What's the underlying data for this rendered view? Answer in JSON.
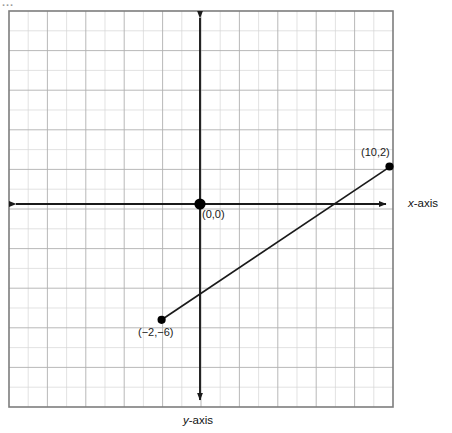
{
  "page": {
    "top_fragment": "...",
    "background": "#ffffff"
  },
  "graph": {
    "title": "",
    "x_axis_label": "x-axis",
    "x_axis_label_italic_part": "x",
    "x_axis_label_rest": "-axis",
    "y_axis_label": "y-axis",
    "y_axis_label_italic_part": "y",
    "y_axis_label_rest": "-axis",
    "frame_color": "#808080",
    "grid_color": "#cfcfcf",
    "grid_major_color": "#a8a8a8",
    "axis_color": "#1a1a1a",
    "line_color": "#1a1a1a",
    "point_color": "#000000",
    "grid": {
      "visible": true,
      "columns": 20,
      "rows": 20,
      "cell_px": 19.2
    },
    "points": [
      {
        "name": "origin",
        "label": "(0,0)",
        "x": 0,
        "y": 0,
        "radius": 5.5
      },
      {
        "name": "endpoint-upper-right",
        "label": "(10,2)",
        "x": 10,
        "y": 2,
        "radius": 4
      },
      {
        "name": "endpoint-lower-left",
        "label": "(−2,−6)",
        "x": -2,
        "y": -6,
        "radius": 4
      }
    ],
    "segment": {
      "name": "line-segment",
      "from": "(−2,−6)",
      "to": "(10,2)",
      "slope": "2/3"
    }
  },
  "chart_data": {
    "type": "scatter",
    "title": "",
    "xlabel": "x-axis",
    "ylabel": "y-axis",
    "xlim": [
      -10,
      10
    ],
    "ylim": [
      -10,
      10
    ],
    "grid": true,
    "legend": "none",
    "points": [
      {
        "label": "(0,0)",
        "x": 0,
        "y": 0
      },
      {
        "label": "(10,2)",
        "x": 10,
        "y": 2
      },
      {
        "label": "(−2,−6)",
        "x": -2,
        "y": -6
      }
    ],
    "series": [
      {
        "name": "segment",
        "x": [
          -2,
          10
        ],
        "y": [
          -6,
          2
        ]
      }
    ],
    "annotations": [
      "(0,0)",
      "(10,2)",
      "(−2,−6)"
    ]
  }
}
